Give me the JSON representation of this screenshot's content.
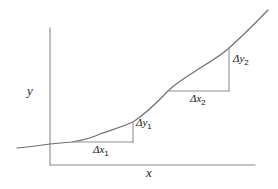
{
  "figure": {
    "background_color": "#ffffff",
    "axes": {
      "y_label": "y",
      "x_label": "x",
      "axis_color": "#8a8a8a",
      "origin": {
        "x": 50,
        "y": 165
      },
      "y_axis_top": {
        "x": 50,
        "y": 28
      },
      "x_axis_right": {
        "x": 255,
        "y": 165
      }
    },
    "curve": {
      "color": "#6e6e6e",
      "description": "monotonically increasing convex curve",
      "points": [
        {
          "x": 17,
          "y": 148
        },
        {
          "x": 50,
          "y": 144
        },
        {
          "x": 72,
          "y": 142
        },
        {
          "x": 100,
          "y": 134
        },
        {
          "x": 133,
          "y": 122
        },
        {
          "x": 168,
          "y": 91
        },
        {
          "x": 200,
          "y": 68
        },
        {
          "x": 229,
          "y": 48
        },
        {
          "x": 268,
          "y": 10
        }
      ]
    },
    "triangles": [
      {
        "name": "slope-triangle-1",
        "x_label": "Δx",
        "x_subscript": "1",
        "y_label": "Δy",
        "y_subscript": "1",
        "left": 72,
        "right": 133,
        "bottom": 142,
        "top": 122,
        "run": 61,
        "rise": 20
      },
      {
        "name": "slope-triangle-2",
        "x_label": "Δx",
        "x_subscript": "2",
        "y_label": "Δy",
        "y_subscript": "2",
        "left": 168,
        "right": 229,
        "bottom": 91,
        "top": 48,
        "run": 61,
        "rise": 43
      }
    ]
  }
}
